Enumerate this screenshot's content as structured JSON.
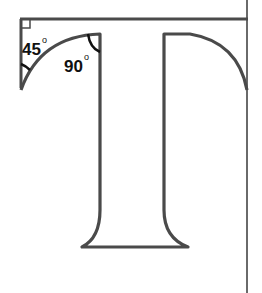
{
  "diagram": {
    "labels": {
      "angle_left": "45",
      "angle_inner": "90",
      "degree_symbol": "o"
    },
    "colors": {
      "stroke": "#4a4a4a",
      "guide": "#555555",
      "background": "#ffffff",
      "text": "#111111"
    }
  }
}
